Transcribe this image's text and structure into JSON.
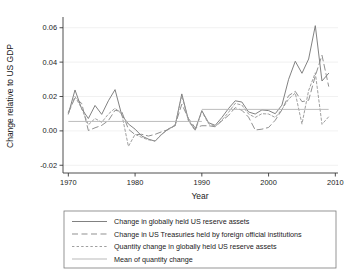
{
  "chart_data": {
    "type": "line",
    "title": "",
    "xlabel": "Year",
    "ylabel": "Change relative to US GDP",
    "xlim": [
      1969.2,
      2010.4
    ],
    "ylim": [
      -0.0245,
      0.0645
    ],
    "xticks": [
      1970,
      1980,
      1990,
      2000,
      2010
    ],
    "xticklabels": [
      "1970",
      "1980",
      "1990",
      "2000",
      "2010"
    ],
    "yticks": [
      -0.02,
      0.0,
      0.02,
      0.04,
      0.06
    ],
    "yticklabels": [
      "-0.02",
      "0.00",
      "0.02",
      "0.04",
      "0.06"
    ],
    "grid": "horizontal-faint",
    "legend_position": "below-plot",
    "series": [
      {
        "name": "Change in globally held US reserve assets",
        "style": "solid",
        "color": "#7a7a7a",
        "x": [
          1970,
          1971,
          1972,
          1973,
          1974,
          1975,
          1976,
          1977,
          1978,
          1979,
          1980,
          1981,
          1982,
          1983,
          1984,
          1985,
          1986,
          1987,
          1988,
          1989,
          1990,
          1991,
          1992,
          1993,
          1994,
          1995,
          1996,
          1997,
          1998,
          1999,
          2000,
          2001,
          2002,
          2003,
          2004,
          2005,
          2006,
          2007,
          2008,
          2009
        ],
        "values": [
          0.0098,
          0.0238,
          0.0128,
          0.0072,
          0.0148,
          0.0096,
          0.0175,
          0.024,
          0.0092,
          0.004,
          0.001,
          -0.003,
          -0.0048,
          -0.006,
          -0.002,
          0.0012,
          0.003,
          0.0215,
          0.0062,
          0.0006,
          0.0118,
          0.0048,
          0.0032,
          0.0078,
          0.013,
          0.0175,
          0.0168,
          0.011,
          0.0098,
          0.0122,
          0.0118,
          0.01,
          0.015,
          0.03,
          0.0405,
          0.0335,
          0.0418,
          0.0612,
          0.029,
          0.0335
        ]
      },
      {
        "name": "Change in US Treasuries held by foreign official institutions",
        "style": "long-dash",
        "color": "#8a8a8a",
        "x": [
          1970,
          1971,
          1972,
          1973,
          1974,
          1975,
          1976,
          1977,
          1978,
          1979,
          1980,
          1981,
          1982,
          1983,
          1984,
          1985,
          1986,
          1987,
          1988,
          1989,
          1990,
          1991,
          1992,
          1993,
          1994,
          1995,
          1996,
          1997,
          1998,
          1999,
          2000,
          2001,
          2002,
          2003,
          2004,
          2005,
          2006,
          2007,
          2008,
          2009
        ],
        "values": [
          0.0108,
          0.0192,
          0.016,
          0.0002,
          0.0018,
          0.0032,
          0.006,
          0.012,
          0.0112,
          0.001,
          -0.0022,
          -0.002,
          -0.003,
          -0.002,
          -0.0005,
          0.0008,
          0.0035,
          0.0155,
          0.0072,
          0.0018,
          0.003,
          0.003,
          0.0024,
          0.0058,
          0.009,
          0.0135,
          0.012,
          0.008,
          0.0005,
          0.001,
          0.002,
          0.0062,
          0.0122,
          0.0205,
          0.023,
          0.017,
          0.0178,
          0.032,
          0.044,
          0.026
        ]
      },
      {
        "name": "Quantity change in globally held US reserve assets",
        "style": "short-dash",
        "color": "#9a9a9a",
        "x": [
          1970,
          1971,
          1972,
          1973,
          1974,
          1975,
          1976,
          1977,
          1978,
          1979,
          1980,
          1981,
          1982,
          1983,
          1984,
          1985,
          1986,
          1987,
          1988,
          1989,
          1990,
          1991,
          1992,
          1993,
          1994,
          1995,
          1996,
          1997,
          1998,
          1999,
          2000,
          2001,
          2002,
          2003,
          2004,
          2005,
          2006,
          2007,
          2008,
          2009
        ],
        "values": [
          0.01,
          0.02,
          0.013,
          0.0035,
          0.0072,
          0.005,
          0.0098,
          0.0132,
          0.0098,
          -0.009,
          -0.002,
          -0.0038,
          -0.0052,
          -0.0058,
          -0.0018,
          0.001,
          0.003,
          0.0205,
          0.0058,
          0.0002,
          0.0112,
          0.0042,
          0.0026,
          0.0062,
          0.0108,
          0.016,
          0.015,
          0.0098,
          0.0078,
          0.01,
          0.0098,
          0.0078,
          0.0125,
          0.0185,
          0.022,
          0.004,
          0.0235,
          0.0338,
          0.0038,
          0.0082
        ]
      },
      {
        "name": "Mean of quantity change",
        "style": "solid-light",
        "color": "#b5b5b5",
        "segments": [
          {
            "x": [
              1970,
              1990
            ],
            "value": 0.0055
          },
          {
            "x": [
              1990,
              2009
            ],
            "value": 0.0125
          }
        ]
      }
    ]
  },
  "legend": {
    "items": [
      {
        "label": "Change in globally held US reserve assets",
        "style": "solid"
      },
      {
        "label": "Change in US Treasuries held by foreign official institutions",
        "style": "long-dash"
      },
      {
        "label": "Quantity change in globally held US reserve assets",
        "style": "short-dash"
      },
      {
        "label": "Mean of quantity change",
        "style": "solid-light"
      }
    ]
  }
}
